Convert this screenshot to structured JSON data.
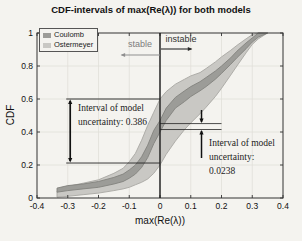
{
  "figure": {
    "title": "CDF-intervals of max(Re(λ)) for both models",
    "xlabel": "max(Re(λ))",
    "ylabel": "CDF",
    "background": "#f4f3ef"
  },
  "legend": {
    "position": "upper-left",
    "items": [
      {
        "label": "Coulomb",
        "color": "#9c9c98"
      },
      {
        "label": "Ostermeyer",
        "color": "#c9c8c4"
      }
    ]
  },
  "annotations": {
    "stable": {
      "label": "stable",
      "arrow_direction": "left",
      "arrow_color": "#8f8f8f"
    },
    "instable": {
      "label": "instable",
      "arrow_direction": "right",
      "arrow_color": "#2a2a2a"
    },
    "left_interval": {
      "line1": "Interval of model",
      "line2": "uncertainty: 0.386",
      "value": 0.386,
      "at_x": 0,
      "cdf_top": 0.6,
      "cdf_bottom": 0.212,
      "line_x_start": -0.305,
      "line_x_end": 0,
      "arrow_x": -0.292
    },
    "right_interval": {
      "line1": "Interval of model",
      "line2": "uncertainty:",
      "line3": "0.0238",
      "value": 0.0238,
      "at_x": 0,
      "cdf_top": 0.451,
      "cdf_bottom": 0.415,
      "line_x_start": 0,
      "line_x_end": 0.2,
      "arrow_x": 0.135
    }
  },
  "chart_data": {
    "type": "area",
    "subtype": "cdf-interval-bands",
    "title": "CDF-intervals of max(Re(λ)) for both models",
    "xlabel": "max(Re(λ))",
    "ylabel": "CDF",
    "xlim": [
      -0.4,
      0.4
    ],
    "ylim": [
      0,
      1
    ],
    "x_ticks": [
      -0.4,
      -0.3,
      -0.2,
      -0.1,
      0,
      0.1,
      0.2,
      0.3,
      0.4
    ],
    "x_tick_labels": [
      "-0.4",
      "-0.3",
      "-0.2",
      "-0.1",
      "0",
      "0.1",
      "0.2",
      "0.3",
      "0.4"
    ],
    "y_ticks": [
      0,
      0.2,
      0.4,
      0.6,
      0.8,
      1
    ],
    "y_tick_labels": [
      "0",
      "0.2",
      "0.4",
      "0.6",
      "0.8",
      "1"
    ],
    "grid": true,
    "legend_position": "upper left",
    "stability_boundary_x": 0,
    "x": [
      -0.335,
      -0.3,
      -0.25,
      -0.2,
      -0.15,
      -0.12,
      -0.1,
      -0.08,
      -0.06,
      -0.04,
      -0.02,
      0,
      0.02,
      0.05,
      0.08,
      0.1,
      0.13,
      0.15,
      0.18,
      0.2,
      0.23,
      0.25,
      0.28,
      0.3,
      0.32,
      0.35
    ],
    "series": [
      {
        "name": "Ostermeyer",
        "band": true,
        "fill": "#c9c8c4",
        "edge": "#a8a7a3",
        "upper": [
          0.04,
          0.07,
          0.09,
          0.11,
          0.15,
          0.18,
          0.22,
          0.27,
          0.35,
          0.44,
          0.52,
          0.6,
          0.645,
          0.69,
          0.72,
          0.74,
          0.76,
          0.785,
          0.825,
          0.855,
          0.895,
          0.925,
          0.965,
          0.99,
          1,
          1
        ],
        "lower": [
          0.005,
          0.01,
          0.02,
          0.03,
          0.045,
          0.055,
          0.065,
          0.08,
          0.095,
          0.115,
          0.15,
          0.2,
          0.265,
          0.345,
          0.415,
          0.455,
          0.51,
          0.55,
          0.615,
          0.665,
          0.745,
          0.8,
          0.88,
          0.93,
          0.965,
          1
        ]
      },
      {
        "name": "Coulomb",
        "band": true,
        "fill": "#9c9c98",
        "edge": "#82827e",
        "upper": [
          0.06,
          0.075,
          0.085,
          0.1,
          0.125,
          0.145,
          0.17,
          0.2,
          0.25,
          0.32,
          0.41,
          0.47,
          0.545,
          0.61,
          0.65,
          0.675,
          0.705,
          0.73,
          0.77,
          0.8,
          0.85,
          0.89,
          0.94,
          0.97,
          1,
          1
        ],
        "lower": [
          0.035,
          0.045,
          0.055,
          0.065,
          0.085,
          0.1,
          0.12,
          0.145,
          0.185,
          0.245,
          0.33,
          0.4,
          0.47,
          0.545,
          0.585,
          0.615,
          0.65,
          0.675,
          0.72,
          0.755,
          0.81,
          0.85,
          0.905,
          0.945,
          0.975,
          1
        ]
      }
    ]
  }
}
